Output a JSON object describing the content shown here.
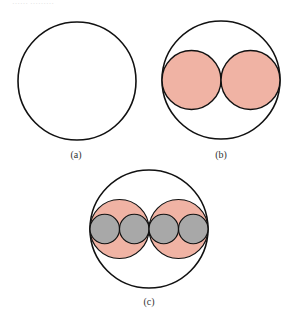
{
  "header_fragment": "…… ………",
  "panels": [
    {
      "id": "a",
      "label": "(a)",
      "description": "Single circle"
    },
    {
      "id": "b",
      "label": "(b)",
      "description": "Circle containing two equal circles"
    },
    {
      "id": "c",
      "label": "(c)",
      "description": "Circle containing two circles, each containing two smaller circles"
    }
  ],
  "colors": {
    "stroke": "#111111",
    "level1_fill": "#f0b3a4",
    "level2_fill": "#a8a8a8",
    "background": "#ffffff"
  }
}
